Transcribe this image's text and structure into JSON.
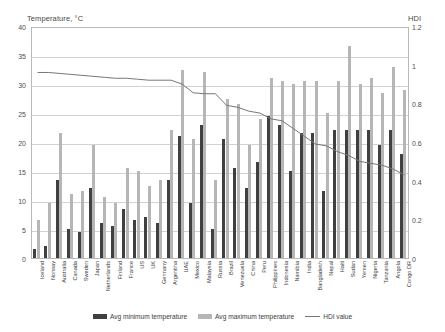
{
  "chart_data": {
    "type": "bar",
    "title": "",
    "ylabel": "Temperature, °C",
    "y2label": "HDI",
    "xlabel": "",
    "ylim": [
      0,
      40
    ],
    "y2lim": [
      0,
      1.2
    ],
    "yticks": [
      "0",
      "5",
      "10",
      "15",
      "20",
      "25",
      "30",
      "35",
      "40"
    ],
    "y2ticks": [
      "0",
      "0.2",
      "0.4",
      "0.6",
      "0.8",
      "1",
      "1.2"
    ],
    "grid": true,
    "legend_position": "bottom",
    "categories": [
      "Iceland",
      "Norway",
      "Australia",
      "Canada",
      "Sweden",
      "Japan",
      "Netherlands",
      "Finland",
      "France",
      "US",
      "UK",
      "Germany",
      "Argentina",
      "UAE",
      "Mexico",
      "Malaysia",
      "Russia",
      "Brazil",
      "Venezuela",
      "China",
      "Peru",
      "Philippines",
      "Indonesia",
      "Namibia",
      "India",
      "Bangladesh",
      "Nepal",
      "Haiti",
      "Sudan",
      "Yemen",
      "Nigeria",
      "Tanzania",
      "Angola",
      "Congo DR"
    ],
    "series": [
      {
        "name": "Avg minimum temperature",
        "color": "#404040",
        "axis": "left",
        "values": [
          1.5,
          2.0,
          13.5,
          5.0,
          4.5,
          12.0,
          6.0,
          5.5,
          8.5,
          6.5,
          7.0,
          6.0,
          13.5,
          21.0,
          9.5,
          23.0,
          5.0,
          20.5,
          15.5,
          12.0,
          16.5,
          24.5,
          23.0,
          15.0,
          21.5,
          21.5,
          11.5,
          22.0,
          22.0,
          22.0,
          22.0,
          19.5,
          22.0,
          18.0
        ]
      },
      {
        "name": "Avg maximum temperature",
        "color": "#b6b6b6",
        "axis": "left",
        "values": [
          6.5,
          9.5,
          21.5,
          11.0,
          11.5,
          19.5,
          10.5,
          9.5,
          15.5,
          15.0,
          12.5,
          13.5,
          22.0,
          32.5,
          20.5,
          32.0,
          13.5,
          27.5,
          26.5,
          19.5,
          24.0,
          31.0,
          30.5,
          30.0,
          30.5,
          30.5,
          25.0,
          30.5,
          36.5,
          30.0,
          31.0,
          28.5,
          33.0,
          29.0
        ]
      },
      {
        "name": "HDI value",
        "color": "#777777",
        "axis": "right",
        "values": [
          0.97,
          0.97,
          0.965,
          0.96,
          0.955,
          0.95,
          0.945,
          0.94,
          0.94,
          0.935,
          0.93,
          0.93,
          0.93,
          0.91,
          0.865,
          0.86,
          0.86,
          0.8,
          0.79,
          0.77,
          0.76,
          0.73,
          0.72,
          0.68,
          0.64,
          0.6,
          0.59,
          0.56,
          0.54,
          0.51,
          0.5,
          0.49,
          0.47,
          0.44
        ]
      }
    ]
  },
  "legend": {
    "items": [
      {
        "label": "Avg minimum temperature",
        "marker": "swatch-dark"
      },
      {
        "label": "Avg maximum temperature",
        "marker": "swatch-light"
      },
      {
        "label": "HDI value",
        "marker": "line-gray"
      }
    ]
  }
}
